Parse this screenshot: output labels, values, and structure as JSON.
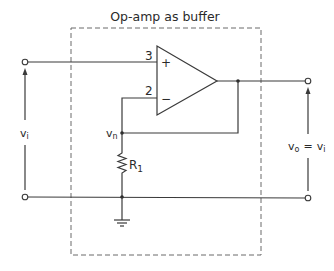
{
  "diagram": {
    "title": "Op-amp as buffer",
    "opamp": {
      "noninverting_pin": "3",
      "inverting_pin": "2",
      "plus_sign": "+",
      "minus_sign": "−"
    },
    "labels": {
      "input_voltage": "v",
      "input_voltage_sub": "i",
      "node_voltage": "v",
      "node_voltage_sub": "n",
      "resistor": "R",
      "resistor_sub": "1",
      "output_voltage": "v",
      "output_voltage_sub": "o",
      "equals": "=",
      "output_equals_rhs": "v",
      "output_equals_rhs_sub": "i"
    },
    "colors": {
      "line": "#3a3a3a",
      "dashed_box": "#6a6a6a",
      "background": "#ffffff"
    }
  }
}
